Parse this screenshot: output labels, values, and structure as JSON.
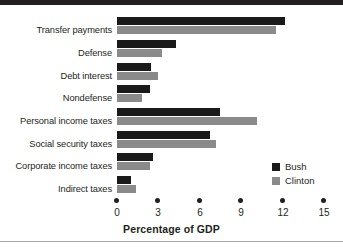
{
  "chart_data": {
    "type": "bar",
    "orientation": "horizontal",
    "title": "",
    "xlabel": "Percentage of GDP",
    "ylabel": "",
    "xlim": [
      0,
      15
    ],
    "xticks": [
      0,
      3,
      6,
      9,
      12,
      15
    ],
    "xtick_labels": [
      "0",
      "3",
      "6",
      "9",
      "12",
      "15"
    ],
    "grid": false,
    "legend_position": "lower-right",
    "categories": [
      "Transfer payments",
      "Defense",
      "Debt interest",
      "Nondefense",
      "Personal income taxes",
      "Social security taxes",
      "Corporate income taxes",
      "Indirect taxes"
    ],
    "series": [
      {
        "name": "Bush",
        "color": "#1a1a1a",
        "values": [
          12.2,
          4.3,
          2.5,
          2.4,
          7.5,
          6.8,
          2.6,
          1.0
        ]
      },
      {
        "name": "Clinton",
        "color": "#8a8a8a",
        "values": [
          11.6,
          3.3,
          3.0,
          1.8,
          10.2,
          7.2,
          2.4,
          1.4
        ]
      }
    ]
  },
  "legend": {
    "items": [
      {
        "label": "Bush"
      },
      {
        "label": "Clinton"
      }
    ]
  },
  "axis": {
    "title": "Percentage of GDP"
  }
}
